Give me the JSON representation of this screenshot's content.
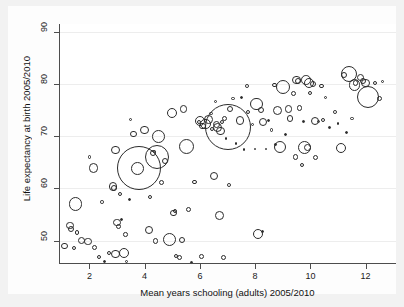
{
  "chart_data": {
    "type": "scatter",
    "title": "",
    "subtitle": "",
    "xlabel": "Mean years schooling (adults) 2005/2010",
    "ylabel": "Life expectancy at birth 2005/2010",
    "xlim": [
      0.9,
      13.1
    ],
    "ylim": [
      45.5,
      91.5
    ],
    "xticks": [
      2,
      4,
      6,
      8,
      10,
      12
    ],
    "yticks": [
      50,
      60,
      70,
      80,
      90
    ],
    "grid": "horizontal",
    "legend": "none",
    "marker": "open-circle",
    "size_encoding": "population",
    "note": "Bubble size encodes a third variable (population); each bubble is one country.",
    "points": [
      {
        "x": 1.1,
        "y": 48.9,
        "r": 3.2
      },
      {
        "x": 1.3,
        "y": 52.9,
        "r": 3.6
      },
      {
        "x": 1.35,
        "y": 52.2,
        "r": 3.0
      },
      {
        "x": 1.45,
        "y": 48.6,
        "r": 2.2
      },
      {
        "x": 1.5,
        "y": 57.0,
        "r": 6.6
      },
      {
        "x": 1.55,
        "y": 51.6,
        "r": 2.4
      },
      {
        "x": 1.7,
        "y": 50.0,
        "r": 3.6
      },
      {
        "x": 1.95,
        "y": 49.8,
        "r": 3.6
      },
      {
        "x": 2.0,
        "y": 66.0,
        "r": 1.7
      },
      {
        "x": 2.15,
        "y": 63.9,
        "r": 4.6
      },
      {
        "x": 2.2,
        "y": 48.6,
        "r": 2.6
      },
      {
        "x": 2.35,
        "y": 46.8,
        "r": 2.0
      },
      {
        "x": 2.45,
        "y": 57.4,
        "r": 1.8
      },
      {
        "x": 2.55,
        "y": 46.0,
        "r": 1.5
      },
      {
        "x": 2.7,
        "y": 47.6,
        "r": 2.0
      },
      {
        "x": 2.85,
        "y": 60.4,
        "r": 4.4
      },
      {
        "x": 2.9,
        "y": 60.0,
        "r": 3.2
      },
      {
        "x": 2.95,
        "y": 67.3,
        "r": 4.2
      },
      {
        "x": 2.95,
        "y": 47.4,
        "r": 4.4
      },
      {
        "x": 3.0,
        "y": 53.5,
        "r": 3.8
      },
      {
        "x": 3.05,
        "y": 52.7,
        "r": 2.8
      },
      {
        "x": 3.1,
        "y": 58.9,
        "r": 2.2
      },
      {
        "x": 3.15,
        "y": 54.0,
        "r": 1.5
      },
      {
        "x": 3.25,
        "y": 47.6,
        "r": 5.2
      },
      {
        "x": 3.3,
        "y": 51.2,
        "r": 2.3
      },
      {
        "x": 3.35,
        "y": 45.9,
        "r": 1.6
      },
      {
        "x": 3.45,
        "y": 57.8,
        "r": 1.5
      },
      {
        "x": 3.5,
        "y": 73.2,
        "r": 1.7
      },
      {
        "x": 3.6,
        "y": 70.4,
        "r": 3.2
      },
      {
        "x": 3.75,
        "y": 63.8,
        "r": 6.4
      },
      {
        "x": 3.8,
        "y": 64.0,
        "r": 22.0
      },
      {
        "x": 4.0,
        "y": 71.2,
        "r": 4.4
      },
      {
        "x": 4.15,
        "y": 52.0,
        "r": 4.0
      },
      {
        "x": 4.2,
        "y": 58.3,
        "r": 2.1
      },
      {
        "x": 4.3,
        "y": 66.7,
        "r": 3.0
      },
      {
        "x": 4.35,
        "y": 67.0,
        "r": 1.6
      },
      {
        "x": 4.4,
        "y": 49.9,
        "r": 2.6
      },
      {
        "x": 4.45,
        "y": 66.0,
        "r": 12.0
      },
      {
        "x": 4.5,
        "y": 70.0,
        "r": 6.4
      },
      {
        "x": 4.6,
        "y": 61.2,
        "r": 2.6
      },
      {
        "x": 4.75,
        "y": 65.3,
        "r": 3.2
      },
      {
        "x": 4.9,
        "y": 50.2,
        "r": 6.6
      },
      {
        "x": 5.0,
        "y": 74.4,
        "r": 5.2
      },
      {
        "x": 5.05,
        "y": 55.3,
        "r": 3.2
      },
      {
        "x": 5.1,
        "y": 55.6,
        "r": 2.0
      },
      {
        "x": 5.15,
        "y": 47.0,
        "r": 2.1
      },
      {
        "x": 5.25,
        "y": 46.8,
        "r": 2.5
      },
      {
        "x": 5.35,
        "y": 50.1,
        "r": 3.0
      },
      {
        "x": 5.4,
        "y": 75.2,
        "r": 3.8
      },
      {
        "x": 5.5,
        "y": 68.0,
        "r": 7.6
      },
      {
        "x": 5.6,
        "y": 56.0,
        "r": 2.5
      },
      {
        "x": 5.7,
        "y": 45.8,
        "r": 1.4
      },
      {
        "x": 5.8,
        "y": 61.2,
        "r": 2.2
      },
      {
        "x": 5.95,
        "y": 72.8,
        "r": 2.0
      },
      {
        "x": 6.0,
        "y": 73.0,
        "r": 5.0
      },
      {
        "x": 6.05,
        "y": 46.9,
        "r": 2.4
      },
      {
        "x": 6.1,
        "y": 72.0,
        "r": 3.2
      },
      {
        "x": 6.2,
        "y": 72.3,
        "r": 5.2
      },
      {
        "x": 6.3,
        "y": 73.2,
        "r": 4.4
      },
      {
        "x": 6.4,
        "y": 74.3,
        "r": 1.7
      },
      {
        "x": 6.45,
        "y": 71.4,
        "r": 2.0
      },
      {
        "x": 6.5,
        "y": 62.4,
        "r": 4.0
      },
      {
        "x": 6.55,
        "y": 76.6,
        "r": 1.6
      },
      {
        "x": 6.6,
        "y": 72.2,
        "r": 3.6
      },
      {
        "x": 6.65,
        "y": 71.6,
        "r": 4.6
      },
      {
        "x": 6.7,
        "y": 54.8,
        "r": 4.4
      },
      {
        "x": 6.75,
        "y": 71.0,
        "r": 4.2
      },
      {
        "x": 6.8,
        "y": 72.7,
        "r": 2.4
      },
      {
        "x": 6.85,
        "y": 46.8,
        "r": 2.6
      },
      {
        "x": 6.9,
        "y": 73.4,
        "r": 2.6
      },
      {
        "x": 6.95,
        "y": 69.6,
        "r": 1.3
      },
      {
        "x": 7.0,
        "y": 71.8,
        "r": 23.0
      },
      {
        "x": 7.05,
        "y": 60.6,
        "r": 1.9
      },
      {
        "x": 7.1,
        "y": 75.2,
        "r": 3.0
      },
      {
        "x": 7.2,
        "y": 77.2,
        "r": 1.6
      },
      {
        "x": 7.3,
        "y": 68.6,
        "r": 1.3
      },
      {
        "x": 7.45,
        "y": 73.0,
        "r": 4.2
      },
      {
        "x": 7.5,
        "y": 77.5,
        "r": 1.5
      },
      {
        "x": 7.6,
        "y": 67.4,
        "r": 1.4
      },
      {
        "x": 7.7,
        "y": 79.6,
        "r": 1.9
      },
      {
        "x": 7.75,
        "y": 74.6,
        "r": 2.0
      },
      {
        "x": 7.9,
        "y": 72.3,
        "r": 1.6
      },
      {
        "x": 8.0,
        "y": 67.5,
        "r": 1.3
      },
      {
        "x": 8.05,
        "y": 76.2,
        "r": 6.2
      },
      {
        "x": 8.1,
        "y": 51.3,
        "r": 5.0
      },
      {
        "x": 8.2,
        "y": 75.0,
        "r": 3.1
      },
      {
        "x": 8.25,
        "y": 51.8,
        "r": 1.5
      },
      {
        "x": 8.3,
        "y": 72.8,
        "r": 4.0
      },
      {
        "x": 8.4,
        "y": 67.5,
        "r": 1.3
      },
      {
        "x": 8.5,
        "y": 73.0,
        "r": 1.5
      },
      {
        "x": 8.6,
        "y": 71.2,
        "r": 1.8
      },
      {
        "x": 8.7,
        "y": 79.8,
        "r": 2.1
      },
      {
        "x": 8.75,
        "y": 68.4,
        "r": 1.4
      },
      {
        "x": 8.8,
        "y": 75.0,
        "r": 4.6
      },
      {
        "x": 8.9,
        "y": 68.0,
        "r": 6.0
      },
      {
        "x": 9.0,
        "y": 79.4,
        "r": 7.0
      },
      {
        "x": 9.1,
        "y": 70.3,
        "r": 1.5
      },
      {
        "x": 9.2,
        "y": 75.2,
        "r": 3.8
      },
      {
        "x": 9.25,
        "y": 73.4,
        "r": 3.2
      },
      {
        "x": 9.4,
        "y": 78.2,
        "r": 2.6
      },
      {
        "x": 9.45,
        "y": 66.0,
        "r": 2.6
      },
      {
        "x": 9.5,
        "y": 80.8,
        "r": 4.2
      },
      {
        "x": 9.55,
        "y": 80.6,
        "r": 3.0
      },
      {
        "x": 9.6,
        "y": 75.4,
        "r": 2.6
      },
      {
        "x": 9.7,
        "y": 64.5,
        "r": 2.2
      },
      {
        "x": 9.75,
        "y": 72.8,
        "r": 1.4
      },
      {
        "x": 9.8,
        "y": 67.8,
        "r": 6.6
      },
      {
        "x": 9.85,
        "y": 80.8,
        "r": 4.8
      },
      {
        "x": 9.9,
        "y": 67.8,
        "r": 3.6
      },
      {
        "x": 9.95,
        "y": 80.2,
        "r": 5.2
      },
      {
        "x": 10.0,
        "y": 78.3,
        "r": 2.0
      },
      {
        "x": 10.1,
        "y": 80.0,
        "r": 3.2
      },
      {
        "x": 10.15,
        "y": 73.0,
        "r": 4.0
      },
      {
        "x": 10.2,
        "y": 66.0,
        "r": 2.5
      },
      {
        "x": 10.3,
        "y": 72.8,
        "r": 1.6
      },
      {
        "x": 10.4,
        "y": 79.6,
        "r": 2.4
      },
      {
        "x": 10.45,
        "y": 73.2,
        "r": 2.0
      },
      {
        "x": 10.55,
        "y": 77.4,
        "r": 1.6
      },
      {
        "x": 10.7,
        "y": 71.6,
        "r": 1.4
      },
      {
        "x": 10.9,
        "y": 74.6,
        "r": 1.9
      },
      {
        "x": 11.0,
        "y": 72.4,
        "r": 1.4
      },
      {
        "x": 11.1,
        "y": 67.8,
        "r": 5.0
      },
      {
        "x": 11.2,
        "y": 81.8,
        "r": 3.0
      },
      {
        "x": 11.3,
        "y": 70.8,
        "r": 1.5
      },
      {
        "x": 11.4,
        "y": 82.0,
        "r": 8.0
      },
      {
        "x": 11.5,
        "y": 73.4,
        "r": 1.8
      },
      {
        "x": 11.6,
        "y": 79.8,
        "r": 5.6
      },
      {
        "x": 11.65,
        "y": 80.2,
        "r": 2.6
      },
      {
        "x": 11.8,
        "y": 81.2,
        "r": 3.6
      },
      {
        "x": 11.9,
        "y": 80.6,
        "r": 3.4
      },
      {
        "x": 12.0,
        "y": 80.2,
        "r": 4.2
      },
      {
        "x": 12.1,
        "y": 77.6,
        "r": 11.0
      },
      {
        "x": 12.35,
        "y": 80.2,
        "r": 2.0
      },
      {
        "x": 12.5,
        "y": 77.2,
        "r": 2.6
      },
      {
        "x": 12.6,
        "y": 80.4,
        "r": 1.6
      }
    ]
  },
  "style": {
    "page_background": "#f2f2f2",
    "figure_background": "#fdfdfd",
    "plot_background": "#ffffff",
    "axis_color": "#4d4d4d",
    "marker_color": "#2b2b2b",
    "grid_color": "#ededed",
    "text_color": "#111111"
  }
}
